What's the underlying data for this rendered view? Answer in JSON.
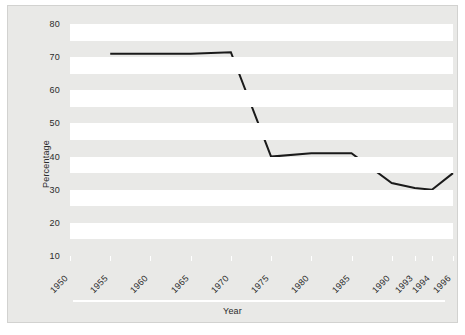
{
  "chart_data": {
    "type": "line",
    "title": "",
    "xlabel": "Year",
    "ylabel": "Percentage",
    "categories": [
      "1950",
      "1955",
      "1960",
      "1965",
      "1970",
      "1975",
      "1980",
      "1985",
      "1990",
      "1993",
      "1994",
      "1996"
    ],
    "x": [
      1950,
      1955,
      1960,
      1965,
      1970,
      1975,
      1980,
      1985,
      1990,
      1993,
      1994,
      1996
    ],
    "series": [
      {
        "name": "Percentage",
        "color": "#1a1a1a",
        "values": [
          null,
          71,
          71,
          71,
          71.5,
          40,
          41,
          41,
          32,
          30.5,
          30,
          35
        ]
      }
    ],
    "ylim": [
      10,
      80
    ],
    "yticks": [
      10,
      20,
      30,
      40,
      50,
      60,
      70,
      80
    ],
    "ytick_labels": [
      "10",
      "20",
      "30",
      "40",
      "50",
      "60",
      "70",
      "80"
    ],
    "grid": false,
    "banded_background": true,
    "band_colors": [
      "#ffffff",
      "#e9e9e7"
    ],
    "legend": null,
    "legend_position": "none",
    "xtick_rotation": -45,
    "plot_background": "#e9e9e7",
    "figure_background": "#ffffff",
    "border_color": "#d2d2d0"
  }
}
